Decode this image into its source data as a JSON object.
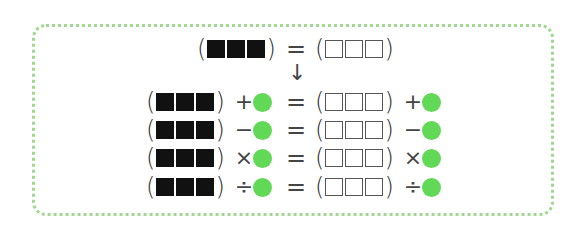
{
  "colors": {
    "border": "#9fd88f",
    "dot": "#62d857",
    "filled_square": "#111111",
    "empty_square_border": "#555555"
  },
  "icons": {
    "filled_square": "black-square-icon",
    "empty_square": "white-square-icon",
    "dot": "green-circle-icon"
  },
  "symbols": {
    "lparen": "(",
    "rparen": ")",
    "equals": "=",
    "arrow": "↓"
  },
  "header_row": {
    "left": {
      "squares": 3,
      "style": "filled"
    },
    "equals": "=",
    "right": {
      "squares": 3,
      "style": "empty"
    }
  },
  "rows": [
    {
      "operator": "+",
      "left_squares": 3,
      "right_squares": 3
    },
    {
      "operator": "−",
      "left_squares": 3,
      "right_squares": 3
    },
    {
      "operator": "×",
      "left_squares": 3,
      "right_squares": 3
    },
    {
      "operator": "÷",
      "left_squares": 3,
      "right_squares": 3
    }
  ]
}
